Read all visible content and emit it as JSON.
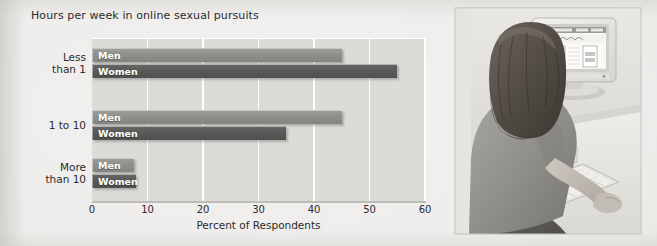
{
  "figure": {
    "title_line1": "Hours per week",
    "title_line2": "in online sexual pursuits",
    "title": "Hours per week\nin online sexual pursuits"
  },
  "chart_data": {
    "type": "bar",
    "orientation": "horizontal",
    "title": "Hours per week in online sexual pursuits",
    "xlabel": "Percent of Respondents",
    "ylabel": "Hours per week in online sexual pursuits",
    "xlim": [
      0,
      60
    ],
    "xticks": [
      0,
      10,
      20,
      30,
      40,
      50,
      60
    ],
    "xticklabels": [
      "0",
      "10",
      "20",
      "30",
      "40",
      "50",
      "60"
    ],
    "grid": "vertical-white-gridlines",
    "legend": "in-bar labels",
    "categories": [
      "Less than 1",
      "1 to 10",
      "More than 10"
    ],
    "category_labels_multiline": [
      "Less\nthan 1",
      "1 to 10",
      "More\nthan 10"
    ],
    "series": [
      {
        "name": "Men",
        "color": "#8e8e8b",
        "values": [
          45,
          45,
          7.5
        ]
      },
      {
        "name": "Women",
        "color": "#595957",
        "values": [
          55,
          35,
          8
        ]
      }
    ]
  },
  "photo": {
    "caption": "",
    "alt_name": "woman-at-computer-photo",
    "description": "grayscale photograph of a seated woman using a desktop computer with a CRT monitor and keyboard"
  }
}
